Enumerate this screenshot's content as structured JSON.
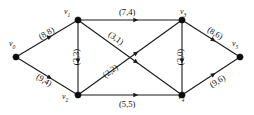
{
  "diagram": {
    "nodes": [
      {
        "id": "n0",
        "label": "v",
        "sub": "0",
        "x": 16,
        "y": 57,
        "label_x": 9,
        "label_y": 39
      },
      {
        "id": "n1",
        "label": "v",
        "sub": "1",
        "x": 78,
        "y": 20,
        "label_x": 64,
        "label_y": 7
      },
      {
        "id": "n2",
        "label": "v",
        "sub": "2",
        "x": 78,
        "y": 95,
        "label_x": 62,
        "label_y": 92
      },
      {
        "id": "n3",
        "label": "v",
        "sub": "3",
        "x": 182,
        "y": 20,
        "label_x": 180,
        "label_y": 7
      },
      {
        "id": "n4",
        "label": "v",
        "sub": "4",
        "x": 182,
        "y": 95,
        "label_x": 178,
        "label_y": 92
      },
      {
        "id": "n5",
        "label": "v",
        "sub": "5",
        "x": 240,
        "y": 57,
        "label_x": 232,
        "label_y": 39
      }
    ],
    "edges": [
      {
        "id": "e0",
        "from": "n0",
        "to": "n1",
        "capacity": 8,
        "flow": 8,
        "label": "(8,8)",
        "label_x": 38,
        "label_y": 28,
        "rotate": -31
      },
      {
        "id": "e1",
        "from": "n0",
        "to": "n2",
        "capacity": 9,
        "flow": 4,
        "label": "(9,4)",
        "label_x": 36,
        "label_y": 75,
        "rotate": 31
      },
      {
        "id": "e2",
        "from": "n1",
        "to": "n2",
        "capacity": 3,
        "flow": 3,
        "label": "(3,3)",
        "label_x": 68,
        "label_y": 52,
        "rotate": -90
      },
      {
        "id": "e3",
        "from": "n1",
        "to": "n3",
        "capacity": 7,
        "flow": 4,
        "label": "(7,4)",
        "label_x": 119,
        "label_y": 7,
        "rotate": 0
      },
      {
        "id": "e4",
        "from": "n1",
        "to": "n4",
        "capacity": 3,
        "flow": 1,
        "label": "(3,1)",
        "label_x": 108,
        "label_y": 33,
        "rotate": 36
      },
      {
        "id": "e5",
        "from": "n2",
        "to": "n3",
        "capacity": 2,
        "flow": 2,
        "label": "(2,2)",
        "label_x": 102,
        "label_y": 66,
        "rotate": -36
      },
      {
        "id": "e6",
        "from": "n2",
        "to": "n4",
        "capacity": 5,
        "flow": 5,
        "label": "(5,5)",
        "label_x": 119,
        "label_y": 99,
        "rotate": 0
      },
      {
        "id": "e7",
        "from": "n3",
        "to": "n4",
        "capacity": 3,
        "flow": 0,
        "label": "(3,0)",
        "label_x": 172,
        "label_y": 52,
        "rotate": -90
      },
      {
        "id": "e8",
        "from": "n3",
        "to": "n5",
        "capacity": 8,
        "flow": 6,
        "label": "(8,6)",
        "label_x": 207,
        "label_y": 28,
        "rotate": 31
      },
      {
        "id": "e9",
        "from": "n4",
        "to": "n5",
        "capacity": 9,
        "flow": 6,
        "label": "(9,6)",
        "label_x": 209,
        "label_y": 76,
        "rotate": -31
      }
    ]
  }
}
